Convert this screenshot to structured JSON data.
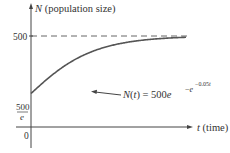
{
  "chart_data": {
    "type": "line",
    "title": "",
    "xlabel": "t (time)",
    "ylabel": "N (population size)",
    "function": "N(t) = 500e^{-e^{-0.05t}}",
    "annotation": {
      "prefix": "N(t) = 500e",
      "exp_base": "−e",
      "exp_exp": "−0.05t"
    },
    "y_ticks": [
      {
        "value": 500,
        "label": "500"
      },
      {
        "value": 183.94,
        "label_num": "500",
        "label_den": "e"
      },
      {
        "value": 0,
        "label": "0"
      }
    ],
    "asymptote": {
      "value": 500,
      "style": "dashed"
    },
    "series": [
      {
        "name": "N(t)",
        "x": [
          0,
          10,
          20,
          30,
          40,
          50,
          60,
          70,
          80,
          90,
          100
        ],
        "values": [
          183.9,
          272.8,
          341.2,
          400.2,
          435.3,
          461.4,
          476.1,
          484.6,
          490.2,
          493.7,
          495.9
        ]
      }
    ],
    "grid": false,
    "legend": null
  }
}
